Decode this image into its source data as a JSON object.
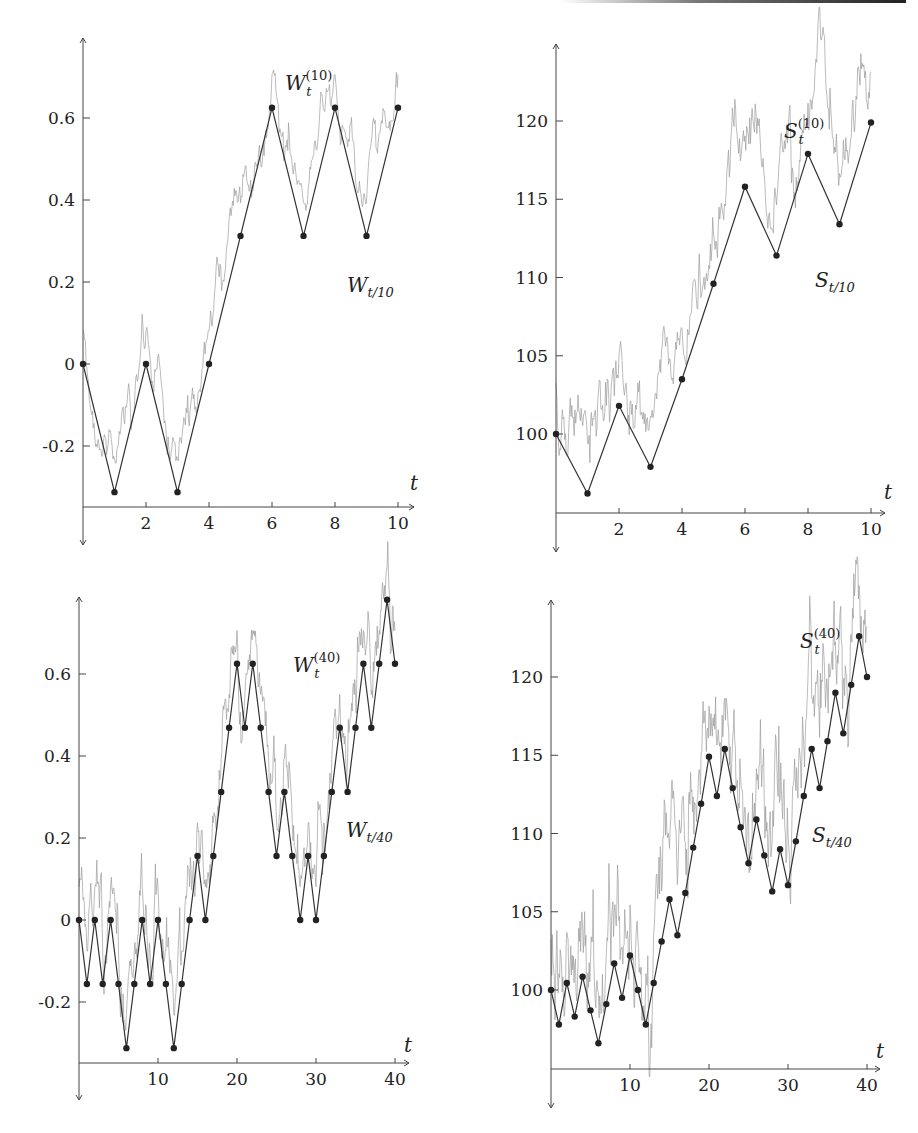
{
  "chart_data": [
    {
      "id": "top-left",
      "type": "line",
      "title": "",
      "xlabel": "t",
      "ylabel": "",
      "x_ticks": [
        2,
        4,
        6,
        8,
        10
      ],
      "y_ticks": [
        -0.2,
        0,
        0.2,
        0.4,
        0.6
      ],
      "y_tick_labels": [
        "-0.2",
        "0",
        "0.2",
        "0.4",
        "0.6"
      ],
      "xlim": [
        0,
        10.5
      ],
      "ylim": [
        -0.4,
        0.8
      ],
      "grid": false,
      "series": [
        {
          "name": "W_t^(10)",
          "label_main": "W",
          "label_sub": "t",
          "label_sup": "(10)",
          "style": "line-markers",
          "x": [
            0,
            1,
            2,
            3,
            4,
            5,
            6,
            7,
            8,
            9,
            10
          ],
          "values": [
            0,
            -0.3125,
            0,
            -0.3125,
            0,
            0.3125,
            0.625,
            0.3125,
            0.625,
            0.3125,
            0.625
          ]
        },
        {
          "name": "W_{t/10}",
          "label_main": "W",
          "label_sub": "t/10",
          "style": "noisy-gray"
        }
      ],
      "labels": {
        "step": {
          "main": "W",
          "sub": "t",
          "sup": "(10)"
        },
        "cont": {
          "main": "W",
          "sub": "t/10"
        },
        "t": "t"
      }
    },
    {
      "id": "top-right",
      "type": "line",
      "title": "",
      "xlabel": "t",
      "x_ticks": [
        2,
        4,
        6,
        8,
        10
      ],
      "y_ticks": [
        100,
        105,
        110,
        115,
        120
      ],
      "y_tick_labels": [
        "100",
        "105",
        "110",
        "115",
        "120"
      ],
      "xlim": [
        0,
        10.5
      ],
      "ylim": [
        94,
        125
      ],
      "grid": false,
      "series": [
        {
          "name": "S_t^(10)",
          "style": "line-markers",
          "x": [
            0,
            1,
            2,
            3,
            4,
            5,
            6,
            7,
            8,
            9,
            10
          ],
          "values": [
            100,
            96.2,
            101.8,
            97.9,
            103.5,
            109.6,
            115.8,
            111.4,
            117.9,
            113.4,
            119.9
          ]
        },
        {
          "name": "S_{t/10}",
          "style": "noisy-gray"
        }
      ],
      "labels": {
        "step": {
          "main": "S",
          "sub": "t",
          "sup": "(10)"
        },
        "cont": {
          "main": "S",
          "sub": "t/10"
        },
        "t": "t"
      }
    },
    {
      "id": "bottom-left",
      "type": "line",
      "title": "",
      "xlabel": "t",
      "x_ticks": [
        10,
        20,
        30,
        40
      ],
      "y_ticks": [
        -0.2,
        0,
        0.2,
        0.4,
        0.6
      ],
      "y_tick_labels": [
        "-0.2",
        "0",
        "0.2",
        "0.4",
        "0.6"
      ],
      "xlim": [
        0,
        42
      ],
      "ylim": [
        -0.4,
        0.8
      ],
      "grid": false,
      "series": [
        {
          "name": "W_t^(40)",
          "style": "line-markers",
          "x": [
            0,
            1,
            2,
            3,
            4,
            5,
            6,
            7,
            8,
            9,
            10,
            11,
            12,
            13,
            14,
            15,
            16,
            17,
            18,
            19,
            20,
            21,
            22,
            23,
            24,
            25,
            26,
            27,
            28,
            29,
            30,
            31,
            32,
            33,
            34,
            35,
            36,
            37,
            38,
            39,
            40
          ],
          "values": [
            0,
            -0.156,
            0,
            -0.156,
            0,
            -0.156,
            -0.3125,
            -0.156,
            0,
            -0.156,
            0,
            -0.156,
            -0.3125,
            -0.156,
            0,
            0.156,
            0,
            0.156,
            0.3125,
            0.469,
            0.625,
            0.469,
            0.625,
            0.469,
            0.3125,
            0.156,
            0.3125,
            0.156,
            0,
            0.156,
            0,
            0.156,
            0.3125,
            0.469,
            0.3125,
            0.469,
            0.625,
            0.469,
            0.625,
            0.781,
            0.625
          ]
        },
        {
          "name": "W_{t/40}",
          "style": "noisy-gray"
        }
      ],
      "labels": {
        "step": {
          "main": "W",
          "sub": "t",
          "sup": "(40)"
        },
        "cont": {
          "main": "W",
          "sub": "t/40"
        },
        "t": "t"
      }
    },
    {
      "id": "bottom-right",
      "type": "line",
      "title": "",
      "xlabel": "t",
      "x_ticks": [
        10,
        20,
        30,
        40
      ],
      "y_ticks": [
        100,
        105,
        110,
        115,
        120
      ],
      "y_tick_labels": [
        "100",
        "105",
        "110",
        "115",
        "120"
      ],
      "xlim": [
        0,
        42
      ],
      "ylim": [
        95,
        125
      ],
      "grid": false,
      "series": [
        {
          "name": "S_t^(40)",
          "style": "line-markers",
          "x": [
            0,
            1,
            2,
            3,
            4,
            5,
            6,
            7,
            8,
            9,
            10,
            11,
            12,
            13,
            14,
            15,
            16,
            17,
            18,
            19,
            20,
            21,
            22,
            23,
            24,
            25,
            26,
            27,
            28,
            29,
            30,
            31,
            32,
            33,
            34,
            35,
            36,
            37,
            38,
            39,
            40
          ],
          "values": [
            100,
            97.8,
            100.45,
            98.3,
            100.85,
            98.7,
            96.6,
            99.1,
            101.7,
            99.5,
            102.2,
            100,
            97.8,
            100.45,
            103.1,
            105.8,
            103.5,
            106.2,
            109.1,
            111.9,
            114.9,
            112.4,
            115.4,
            112.9,
            110.4,
            108.1,
            110.9,
            108.6,
            106.3,
            109.0,
            106.7,
            109.5,
            112.4,
            115.4,
            112.9,
            115.9,
            119.0,
            116.4,
            119.5,
            122.6,
            120.0
          ]
        },
        {
          "name": "S_{t/40}",
          "style": "noisy-gray"
        }
      ],
      "labels": {
        "step": {
          "main": "S",
          "sub": "t",
          "sup": "(40)"
        },
        "cont": {
          "main": "S",
          "sub": "t/40"
        },
        "t": "t"
      }
    }
  ],
  "layout": {
    "panels": [
      {
        "x0": 83,
        "xunit": 31.5,
        "y0ref": 364,
        "yref": 0,
        "ypx": 410,
        "xaxisY": 507,
        "axisTop": 38,
        "axisBottom": 545,
        "xEnd": 414,
        "stepLabel": [
          285,
          90
        ],
        "contLabel": [
          347,
          292
        ],
        "tLabel": [
          410,
          490
        ],
        "ytickX": 92
      },
      {
        "x0": 556,
        "xunit": 31.5,
        "y0ref": 434,
        "yref": 100,
        "ypx": 15.65,
        "xaxisY": 513,
        "axisTop": 44,
        "axisBottom": 552,
        "xEnd": 885,
        "stepLabel": [
          784,
          138
        ],
        "contLabel": [
          815,
          287
        ],
        "tLabel": [
          884,
          499
        ],
        "ytickX": 565
      },
      {
        "x0": 79,
        "xunit": 7.9,
        "y0ref": 920,
        "yref": 0,
        "ypx": 410,
        "xaxisY": 1063,
        "axisTop": 597,
        "axisBottom": 1100,
        "xEnd": 409,
        "stepLabel": [
          293,
          672
        ],
        "contLabel": [
          346,
          837
        ],
        "tLabel": [
          404,
          1052
        ],
        "ytickX": 88
      },
      {
        "x0": 551,
        "xunit": 7.9,
        "y0ref": 990,
        "yref": 100,
        "ypx": 15.65,
        "xaxisY": 1069,
        "axisTop": 600,
        "axisBottom": 1108,
        "xEnd": 880,
        "stepLabel": [
          800,
          648
        ],
        "contLabel": [
          812,
          842
        ],
        "tLabel": [
          876,
          1058
        ],
        "ytickX": 560
      }
    ]
  }
}
